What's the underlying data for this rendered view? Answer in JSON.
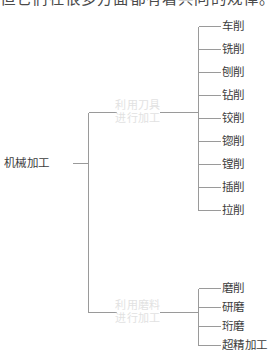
{
  "page": {
    "top_paragraph": "但它们在很多方面都有着共同的规律。"
  },
  "diagram": {
    "type": "tree",
    "orientation": "left-to-right",
    "root": {
      "label": "机械加工"
    },
    "branches": [
      {
        "label_line1": "利用刀具",
        "label_line2": "进行加工",
        "leaves": [
          "车削",
          "铣削",
          "刨削",
          "钻削",
          "铰削",
          "锪削",
          "镗削",
          "插削",
          "拉削"
        ]
      },
      {
        "label_line1": "利用磨料",
        "label_line2": "进行加工",
        "leaves": [
          "磨削",
          "研磨",
          "珩磨",
          "超精加工"
        ]
      }
    ]
  },
  "colors": {
    "line": "#9a9a9a",
    "leaf_text": "#3d3d3d",
    "root_text": "#3d3d3d",
    "branch_text": "#e2e2e2",
    "background": "#ffffff"
  }
}
